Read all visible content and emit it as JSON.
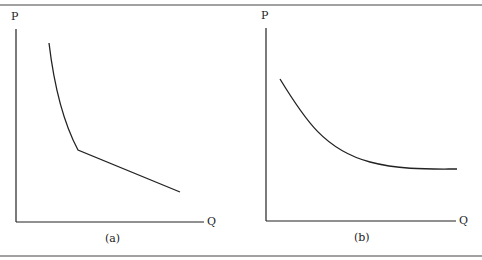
{
  "panels": [
    {
      "id": "a",
      "caption": "(a)",
      "y_axis_label": "P",
      "x_axis_label": "Q",
      "curve": "kinked demand curve: steep convex segment then flatter linear segment"
    },
    {
      "id": "b",
      "caption": "(b)",
      "y_axis_label": "P",
      "x_axis_label": "Q",
      "curve": "smooth convex downward-sloping demand curve flattening out"
    }
  ],
  "colors": {
    "line": "#222222",
    "rule": "#333333",
    "background": "#ffffff"
  }
}
